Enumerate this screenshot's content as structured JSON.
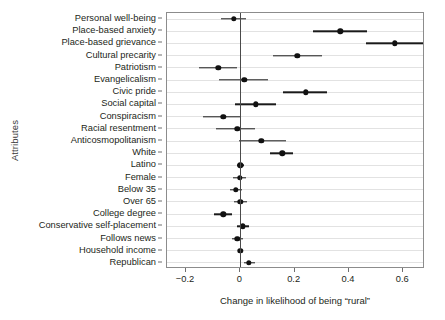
{
  "chart_data": {
    "type": "scatter",
    "title": "",
    "xlabel": "Change in likelihood of being “rural”",
    "ylabel": "Attributes",
    "xlim": [
      -0.27,
      0.68
    ],
    "xticks": [
      -0.2,
      0,
      0.2,
      0.4,
      0.6
    ],
    "xtick_labels": [
      "−0.2",
      "0",
      "0.2",
      "0.4",
      "0.6"
    ],
    "grid": true,
    "legend": "none",
    "zero_reference_line": 0,
    "categories": [
      "Personal well-being",
      "Place-based anxiety",
      "Place-based grievance",
      "Cultural precarity",
      "Patriotism",
      "Evangelicalism",
      "Civic pride",
      "Social capital",
      "Conspiracism",
      "Racial resentment",
      "Anticosmopolitanism",
      "White",
      "Latino",
      "Female",
      "Below 35",
      "Over 65",
      "College degree",
      "Conservative self-placement",
      "Follows news",
      "Household income",
      "Republican"
    ],
    "values": [
      -0.025,
      0.368,
      0.568,
      0.21,
      -0.081,
      0.014,
      0.24,
      0.057,
      -0.063,
      -0.011,
      0.077,
      0.155,
      0.0,
      -0.003,
      -0.017,
      0.0,
      -0.063,
      0.01,
      -0.011,
      0.0,
      0.032
    ],
    "ci_low": [
      -0.072,
      0.268,
      0.462,
      0.12,
      -0.152,
      -0.078,
      0.158,
      -0.018,
      -0.136,
      -0.09,
      -0.005,
      0.11,
      -0.012,
      -0.027,
      -0.038,
      -0.023,
      -0.098,
      -0.012,
      -0.03,
      -0.01,
      0.012
    ],
    "ci_high": [
      0.02,
      0.468,
      0.672,
      0.3,
      -0.013,
      0.103,
      0.32,
      0.132,
      0.004,
      0.053,
      0.168,
      0.195,
      0.013,
      0.021,
      0.005,
      0.026,
      -0.03,
      0.033,
      0.009,
      0.011,
      0.053
    ]
  },
  "style": {
    "point_color": "#111111",
    "bar_color": "#1a1a1a",
    "grid_color": "#e2e2e2",
    "axis_color": "#8c8c8c",
    "zero_line_color": "#4a4a4a",
    "background": "#ffffff"
  }
}
